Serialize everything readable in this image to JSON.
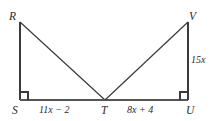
{
  "figure": {
    "type": "geometry-diagram",
    "background_color": "#ffffff",
    "stroke_color": "#3a3a3a",
    "text_color": "#2b2b2b",
    "vertices": [
      {
        "name": "R",
        "label": "R",
        "x": 20,
        "y": 22
      },
      {
        "name": "S",
        "label": "S",
        "x": 20,
        "y": 100
      },
      {
        "name": "T",
        "label": "T",
        "x": 105,
        "y": 100
      },
      {
        "name": "U",
        "label": "U",
        "x": 188,
        "y": 100
      },
      {
        "name": "V",
        "label": "V",
        "x": 188,
        "y": 22
      }
    ],
    "segments": [
      {
        "name": "segment-RS",
        "from": "R",
        "to": "S"
      },
      {
        "name": "segment-RT",
        "from": "R",
        "to": "T"
      },
      {
        "name": "segment-ST",
        "from": "S",
        "to": "T"
      },
      {
        "name": "segment-TU",
        "from": "T",
        "to": "U"
      },
      {
        "name": "segment-TV",
        "from": "T",
        "to": "V"
      },
      {
        "name": "segment-UV",
        "from": "U",
        "to": "V"
      }
    ],
    "right_angles": [
      {
        "name": "right-angle-at-S",
        "vertex": "S"
      },
      {
        "name": "right-angle-at-U",
        "vertex": "U"
      }
    ],
    "measures": {
      "segment_ST": "11x − 2",
      "segment_TU": "8x + 4",
      "segment_UV": "15x"
    }
  }
}
